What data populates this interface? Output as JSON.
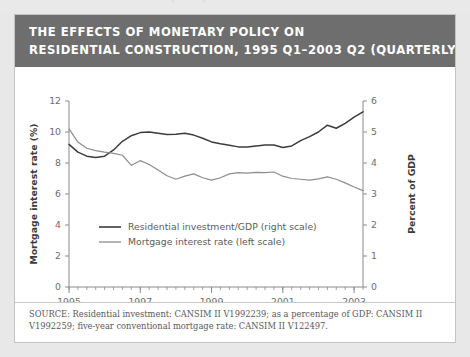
{
  "page": {
    "bleed_text": "The Effects of Monetary Policy on Residential Construction"
  },
  "card": {
    "title_line_1": "THE EFFECTS OF MONETARY POLICY ON",
    "title_line_2": "RESIDENTIAL CONSTRUCTION, 1995 Q1–2003 Q2 (QUARTERLY",
    "source_line_1": "SOURCE: Residential investment: CANSIM II V1992239; as a percentage of GDP: CANSIM II",
    "source_line_2": "V1992259; five-year conventional mortgage rate: CANSIM II V122497."
  },
  "colors": {
    "banner": "#6e6e6e",
    "card_border": "#c4c4c4",
    "page_background": "#e8e8e8",
    "series_investment": "#3c3c3e",
    "series_mortgage": "#8d8d8f",
    "axis": "#8a8a8c"
  },
  "chart_data": {
    "type": "line",
    "title": "THE EFFECTS OF MONETARY POLICY ON RESIDENTIAL CONSTRUCTION, 1995 Q1–2003 Q2 (QUARTERLY",
    "xlabel": "",
    "ylabel": "Mortgage interest rate (%)",
    "y2label": "Percent of GDP",
    "grid": false,
    "legend_position": "center-left",
    "xlim": [
      1995.0,
      2003.25
    ],
    "ylim": [
      0,
      12
    ],
    "y2lim": [
      0,
      6
    ],
    "yticks": [
      0,
      2,
      4,
      6,
      8,
      10,
      12
    ],
    "y2ticks": [
      0,
      1,
      2,
      3,
      4,
      5,
      6
    ],
    "xticks": [
      1995,
      1997,
      1999,
      2001,
      2003
    ],
    "xtick_labels": [
      "1995",
      "1997",
      "1999",
      "2001",
      "2003"
    ],
    "xminorticks": [
      1996,
      1998,
      2000,
      2002
    ],
    "x": [
      1995.0,
      1995.25,
      1995.5,
      1995.75,
      1996.0,
      1996.25,
      1996.5,
      1996.75,
      1997.0,
      1997.25,
      1997.5,
      1997.75,
      1998.0,
      1998.25,
      1998.5,
      1998.75,
      1999.0,
      1999.25,
      1999.5,
      1999.75,
      2000.0,
      2000.25,
      2000.5,
      2000.75,
      2001.0,
      2001.25,
      2001.5,
      2001.75,
      2002.0,
      2002.25,
      2002.5,
      2002.75,
      2003.0,
      2003.25
    ],
    "x_quarter_labels": [
      "1995 Q1",
      "1995 Q2",
      "1995 Q3",
      "1995 Q4",
      "1996 Q1",
      "1996 Q2",
      "1996 Q3",
      "1996 Q4",
      "1997 Q1",
      "1997 Q2",
      "1997 Q3",
      "1997 Q4",
      "1998 Q1",
      "1998 Q2",
      "1998 Q3",
      "1998 Q4",
      "1999 Q1",
      "1999 Q2",
      "1999 Q3",
      "1999 Q4",
      "2000 Q1",
      "2000 Q2",
      "2000 Q3",
      "2000 Q4",
      "2001 Q1",
      "2001 Q2",
      "2001 Q3",
      "2001 Q4",
      "2002 Q1",
      "2002 Q2",
      "2002 Q3",
      "2002 Q4",
      "2003 Q1",
      "2003 Q2"
    ],
    "series": [
      {
        "name": "Residential investment/GDP (right scale)",
        "axis": "right",
        "units": "Percent of GDP",
        "color": "#3c3c3e",
        "values": [
          4.6,
          4.35,
          4.22,
          4.18,
          4.22,
          4.42,
          4.7,
          4.88,
          4.98,
          5.0,
          4.96,
          4.92,
          4.93,
          4.96,
          4.9,
          4.8,
          4.68,
          4.62,
          4.57,
          4.52,
          4.52,
          4.55,
          4.58,
          4.58,
          4.5,
          4.55,
          4.72,
          4.85,
          5.0,
          5.22,
          5.12,
          5.28,
          5.48,
          5.65
        ]
      },
      {
        "name": "Mortgage interest rate (left scale)",
        "axis": "left",
        "units": "%",
        "color": "#8d8d8f",
        "values": [
          10.2,
          9.35,
          8.95,
          8.8,
          8.7,
          8.62,
          8.5,
          7.85,
          8.15,
          7.9,
          7.55,
          7.18,
          6.95,
          7.15,
          7.3,
          7.05,
          6.9,
          7.05,
          7.3,
          7.38,
          7.35,
          7.4,
          7.38,
          7.42,
          7.15,
          7.0,
          6.95,
          6.9,
          6.98,
          7.1,
          6.95,
          6.72,
          6.45,
          6.22
        ]
      }
    ],
    "legend": [
      "Residential investment/GDP (right scale)",
      "Mortgage interest rate (left scale)"
    ]
  }
}
